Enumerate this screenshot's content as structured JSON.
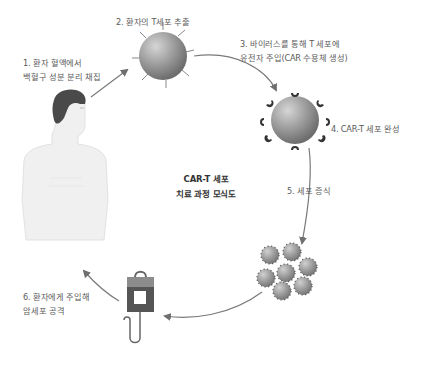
{
  "diagram": {
    "title_lines": [
      "CAR-T 세포",
      "치료 과정 모식도"
    ],
    "steps": [
      {
        "id": 1,
        "lines": [
          "1. 환자 혈액에서",
          "백혈구 성분 분리 채집"
        ],
        "icon": "human-body-icon"
      },
      {
        "id": 2,
        "lines": [
          "2. 환자의 T세포 추출"
        ],
        "icon": "t-cell-icon"
      },
      {
        "id": 3,
        "lines": [
          "3. 바이러스를 통해 T 세포에",
          "유전자 주입(CAR 수용체 생성)"
        ],
        "icon": "arrow-icon"
      },
      {
        "id": 4,
        "lines": [
          "4. CAR-T 세포 완성"
        ],
        "icon": "car-t-cell-icon"
      },
      {
        "id": 5,
        "lines": [
          "5. 세포 증식"
        ],
        "icon": "cell-cluster-icon"
      },
      {
        "id": 6,
        "lines": [
          "6. 환자에게 주입해",
          "암세포 공격"
        ],
        "icon": "iv-bag-icon"
      }
    ],
    "flow": "clockwise cycle: 1 → 2 → 3 → 4 → 5 → 6 → 1",
    "colors": {
      "text": "#5a5a5a",
      "title": "#333333",
      "arrow": "#777777",
      "cell": "#9a9a9a",
      "receptor": "#3a3a3a",
      "hair": "#4a4a4a",
      "skin": "#eeeeee",
      "bag_top": "#8a8a8a",
      "bag_bottom": "#555555"
    }
  }
}
